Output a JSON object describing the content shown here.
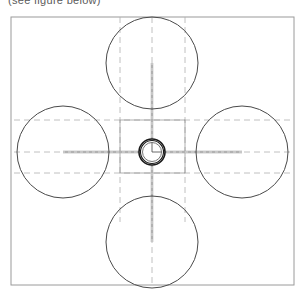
{
  "caption": {
    "text": "(see figure below)",
    "visible_fragment": true
  },
  "drawing": {
    "title": "Quad-rotor propeller disc layout",
    "type": "technical-line-drawing",
    "colors": {
      "frame_stroke": "#9a9a9a",
      "circle_stroke": "#4a4a4a",
      "hub_stroke": "#1a1a1a",
      "centerline_stroke": "#b0b0b0",
      "construction_stroke": "#8e8e8e",
      "arm_stroke": "#9a9a9a",
      "background": "#ffffff"
    },
    "frame": {
      "label": "outer-boundary-rectangle",
      "x": 11,
      "y": 17,
      "width": 283,
      "height": 268,
      "stroke_width": 1
    },
    "center": {
      "x": 152,
      "y": 152
    },
    "hub": {
      "label": "central-hub",
      "rings": [
        13,
        11.5,
        9.5
      ],
      "inner_fill": "#ffffff"
    },
    "rotors": [
      {
        "name": "rotor-top",
        "cx": 152,
        "cy": 63,
        "r": 46
      },
      {
        "name": "rotor-right",
        "cx": 242,
        "cy": 152,
        "r": 46
      },
      {
        "name": "rotor-bottom",
        "cx": 152,
        "cy": 242,
        "r": 46
      },
      {
        "name": "rotor-left",
        "cx": 63,
        "cy": 152,
        "r": 46
      }
    ],
    "arms": [
      {
        "name": "arm-up",
        "x1": 152,
        "y1": 152,
        "x2": 152,
        "y2": 63
      },
      {
        "name": "arm-right",
        "x1": 152,
        "y1": 152,
        "x2": 242,
        "y2": 152
      },
      {
        "name": "arm-down",
        "x1": 152,
        "y1": 152,
        "x2": 152,
        "y2": 242
      },
      {
        "name": "arm-left",
        "x1": 152,
        "y1": 152,
        "x2": 63,
        "y2": 152
      }
    ],
    "construction_lines": {
      "vertical": [
        {
          "name": "centerline-vertical-left",
          "x": 120,
          "y1": 17,
          "y2": 222
        },
        {
          "name": "centerline-vertical-axis",
          "x": 152,
          "y1": 17,
          "y2": 285
        },
        {
          "name": "centerline-vertical-right",
          "x": 185,
          "y1": 17,
          "y2": 222
        }
      ],
      "horizontal": [
        {
          "name": "centerline-horizontal-upper",
          "y": 120,
          "x1": 14,
          "x2": 291
        },
        {
          "name": "centerline-horizontal-axis",
          "y": 152,
          "x1": 14,
          "x2": 291
        },
        {
          "name": "centerline-horizontal-lower",
          "y": 173,
          "x1": 14,
          "x2": 291
        }
      ]
    },
    "inner_box": {
      "name": "hub-construction-square",
      "x": 120,
      "y": 120,
      "width": 65,
      "height": 53
    }
  }
}
